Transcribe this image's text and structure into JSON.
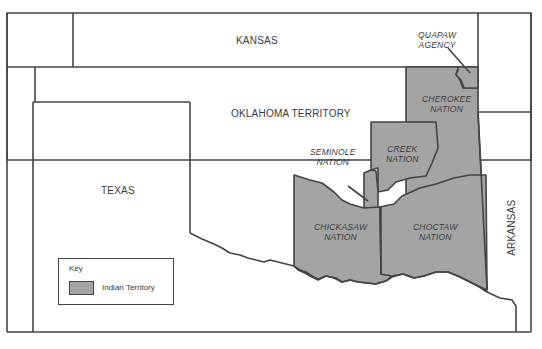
{
  "map": {
    "colors": {
      "indian_territory_fill": "#a4a4a4",
      "border": "#444444",
      "background": "#ffffff",
      "label_text": "#3a3a3a"
    },
    "regions": {
      "kansas": "KANSAS",
      "oklahoma_territory": "OKLAHOMA TERRITORY",
      "texas": "TEXAS",
      "arkansas": "ARKANSAS"
    },
    "nations": {
      "quapaw": [
        "QUAPAW",
        "AGENCY"
      ],
      "cherokee": [
        "CHEROKEE",
        "NATION"
      ],
      "creek": [
        "CREEK",
        "NATION"
      ],
      "seminole": [
        "SEMINOLE",
        "NATION"
      ],
      "chickasaw": [
        "CHICKASAW",
        "NATION"
      ],
      "choctaw": [
        "CHOCTAW",
        "NATION"
      ]
    },
    "legend": {
      "title": "Key",
      "items": [
        {
          "label": "Indian Territory",
          "color": "#a4a4a4"
        }
      ]
    }
  }
}
